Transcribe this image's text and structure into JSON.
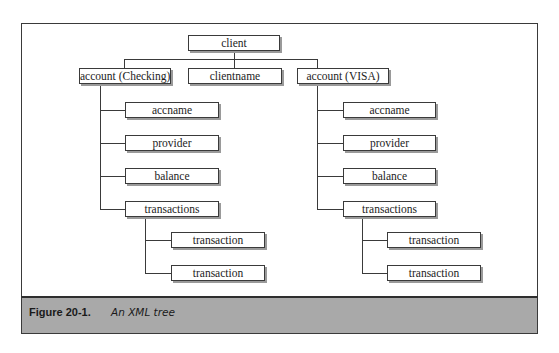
{
  "diagram": {
    "title": "XML tree",
    "nodes": {
      "client": "client",
      "account_checking": "account (Checking)",
      "clientname": "clientname",
      "account_visa": "account (VISA)",
      "left": {
        "accname": "accname",
        "provider": "provider",
        "balance": "balance",
        "transactions": "transactions",
        "transaction_1": "transaction",
        "transaction_2": "transaction"
      },
      "right": {
        "accname": "accname",
        "provider": "provider",
        "balance": "balance",
        "transactions": "transactions",
        "transaction_1": "transaction",
        "transaction_2": "transaction"
      }
    },
    "edges": [
      [
        "client",
        "account (Checking)"
      ],
      [
        "client",
        "clientname"
      ],
      [
        "client",
        "account (VISA)"
      ],
      [
        "account (Checking)",
        "accname"
      ],
      [
        "account (Checking)",
        "provider"
      ],
      [
        "account (Checking)",
        "balance"
      ],
      [
        "account (Checking)",
        "transactions"
      ],
      [
        "transactions",
        "transaction"
      ],
      [
        "transactions",
        "transaction"
      ],
      [
        "account (VISA)",
        "accname"
      ],
      [
        "account (VISA)",
        "provider"
      ],
      [
        "account (VISA)",
        "balance"
      ],
      [
        "account (VISA)",
        "transactions"
      ],
      [
        "transactions",
        "transaction"
      ],
      [
        "transactions",
        "transaction"
      ]
    ]
  },
  "caption": {
    "label": "Figure 20-1.",
    "text": "An XML tree"
  }
}
